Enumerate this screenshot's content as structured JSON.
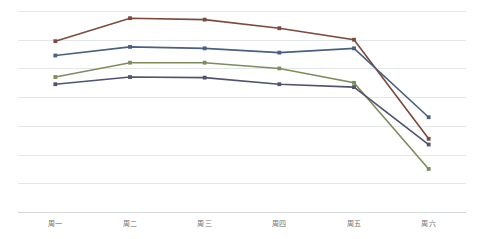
{
  "chart_data": {
    "type": "line",
    "title": "",
    "subtitle": "",
    "xlabel": "",
    "ylabel": "",
    "categories": [
      "周一",
      "周二",
      "周三",
      "周四",
      "周五",
      "周六"
    ],
    "ylim": [
      0,
      800
    ],
    "yticks": [
      0,
      100,
      200,
      300,
      400,
      500,
      600,
      700
    ],
    "ytick_labels_visible": false,
    "grid": true,
    "grid_axis": "y",
    "legend": false,
    "legend_position": "none",
    "series": [
      {
        "name": "系列1",
        "color": "#7a4a3c",
        "values": [
          595,
          675,
          670,
          640,
          600,
          255
        ]
      },
      {
        "name": "系列2",
        "color": "#4a6080",
        "values": [
          545,
          575,
          570,
          555,
          570,
          330
        ]
      },
      {
        "name": "系列3",
        "color": "#7e8c5c",
        "values": [
          470,
          520,
          520,
          500,
          450,
          150
        ]
      },
      {
        "name": "系列4",
        "color": "#4f5370",
        "values": [
          445,
          470,
          468,
          445,
          435,
          235
        ]
      }
    ]
  },
  "axis": {
    "tick_labels": [
      "周一",
      "周二",
      "周三",
      "周四",
      "周五",
      "周六"
    ]
  },
  "colors": {
    "gridline": "#e4e7ea",
    "axis": "#d5d8dc",
    "tick_text": "#6f6f6f",
    "background": "#ffffff"
  }
}
